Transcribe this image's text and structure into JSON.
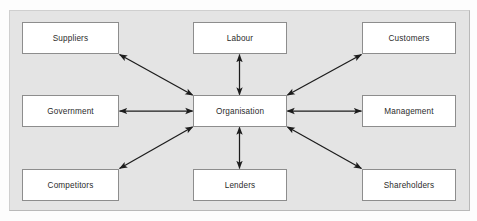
{
  "diagram": {
    "type": "hub-and-spoke",
    "panel_color": "#e4e4e4",
    "node_fill": "#ffffff",
    "node_border": "#8d8d8d",
    "connector_color": "#1c1c1c",
    "center": {
      "id": "organisation",
      "label": "Organisation"
    },
    "nodes": [
      {
        "id": "suppliers",
        "label": "Suppliers",
        "position": "top-left"
      },
      {
        "id": "labour",
        "label": "Labour",
        "position": "top-center"
      },
      {
        "id": "customers",
        "label": "Customers",
        "position": "top-right"
      },
      {
        "id": "government",
        "label": "Government",
        "position": "middle-left"
      },
      {
        "id": "organisation",
        "label": "Organisation",
        "position": "middle-center"
      },
      {
        "id": "management",
        "label": "Management",
        "position": "middle-right"
      },
      {
        "id": "competitors",
        "label": "Competitors",
        "position": "bottom-left"
      },
      {
        "id": "lenders",
        "label": "Lenders",
        "position": "bottom-center"
      },
      {
        "id": "shareholders",
        "label": "Shareholders",
        "position": "bottom-right"
      }
    ],
    "connectors": [
      {
        "from": "organisation",
        "to": "suppliers",
        "style": "double-arrow",
        "orientation": "diagonal"
      },
      {
        "from": "organisation",
        "to": "labour",
        "style": "double-arrow",
        "orientation": "vertical"
      },
      {
        "from": "organisation",
        "to": "customers",
        "style": "double-arrow",
        "orientation": "diagonal"
      },
      {
        "from": "organisation",
        "to": "government",
        "style": "double-arrow",
        "orientation": "horizontal"
      },
      {
        "from": "organisation",
        "to": "management",
        "style": "double-arrow",
        "orientation": "horizontal"
      },
      {
        "from": "organisation",
        "to": "competitors",
        "style": "double-arrow",
        "orientation": "diagonal"
      },
      {
        "from": "organisation",
        "to": "lenders",
        "style": "double-arrow",
        "orientation": "vertical"
      },
      {
        "from": "organisation",
        "to": "shareholders",
        "style": "double-arrow",
        "orientation": "diagonal"
      }
    ]
  }
}
